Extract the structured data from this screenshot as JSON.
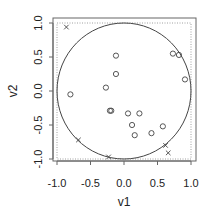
{
  "chart_data": {
    "type": "scatter",
    "title": "",
    "xlabel": "v1",
    "ylabel": "v2",
    "xlim": [
      -1.05,
      1.05
    ],
    "ylim": [
      -1.05,
      1.05
    ],
    "x_ticks": [
      -1.0,
      -0.5,
      0.0,
      0.5,
      1.0
    ],
    "x_tick_labels": [
      "-1.0",
      "-0.5",
      "0.0",
      "0.5",
      "1.0"
    ],
    "y_ticks": [
      -1.0,
      -0.5,
      0.0,
      0.5,
      1.0
    ],
    "y_tick_labels": [
      "-1.0",
      "-0.5",
      "0.0",
      "0.5",
      "1.0"
    ],
    "grid": false,
    "annotations": [
      "unit circle",
      "dotted square boundary at +/-1"
    ],
    "series": [
      {
        "name": "inside",
        "marker": "circle",
        "points": [
          {
            "x": -0.12,
            "y": 0.52
          },
          {
            "x": 0.73,
            "y": 0.55
          },
          {
            "x": 0.82,
            "y": 0.53
          },
          {
            "x": -0.12,
            "y": 0.25
          },
          {
            "x": 0.91,
            "y": 0.17
          },
          {
            "x": -0.27,
            "y": 0.05
          },
          {
            "x": -0.8,
            "y": -0.05
          },
          {
            "x": -0.21,
            "y": -0.29
          },
          {
            "x": -0.19,
            "y": -0.29
          },
          {
            "x": 0.06,
            "y": -0.33
          },
          {
            "x": 0.23,
            "y": -0.33
          },
          {
            "x": 0.12,
            "y": -0.5
          },
          {
            "x": 0.58,
            "y": -0.52
          },
          {
            "x": 0.16,
            "y": -0.65
          },
          {
            "x": 0.41,
            "y": -0.62
          }
        ]
      },
      {
        "name": "outside",
        "marker": "cross",
        "points": [
          {
            "x": -0.86,
            "y": 0.94
          },
          {
            "x": -0.68,
            "y": -0.72
          },
          {
            "x": -0.23,
            "y": -0.97
          },
          {
            "x": 0.62,
            "y": -0.8
          },
          {
            "x": 0.66,
            "y": -0.91
          }
        ]
      }
    ]
  }
}
